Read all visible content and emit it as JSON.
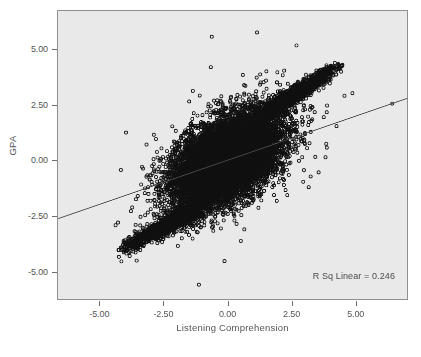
{
  "chart_data": {
    "type": "scatter",
    "title": "",
    "xlabel": "Listening Comprehension",
    "ylabel": "GPA",
    "xlim": [
      -6.65,
      7.04
    ],
    "ylim": [
      -6.27,
      6.74
    ],
    "xticks": [
      -5.0,
      -2.5,
      0.0,
      2.5,
      5.0
    ],
    "yticks": [
      5.0,
      2.5,
      0.0,
      -2.5,
      -5.0
    ],
    "xtick_labels": [
      "-5.00",
      "-2.50",
      "0.00",
      "2.50",
      "5.00"
    ],
    "ytick_labels": [
      "5.00",
      "2.50",
      "0.00",
      "-2.50",
      "-5.00"
    ],
    "grid": false,
    "legend": null,
    "annotations": [
      {
        "name": "r-squared",
        "text": "R Sq Linear = 0.246",
        "value": 0.246,
        "position": "bottom-right"
      }
    ],
    "fit_line": {
      "type": "linear",
      "r_squared": 0.246,
      "slope": 0.3965,
      "intercept": 0.0,
      "x_start": -6.65,
      "y_start": -2.64,
      "x_end": 7.04,
      "y_end": 2.79
    },
    "marker": {
      "shape": "circle-open",
      "size_px": 3.1,
      "edge_color": "#111111",
      "fill_color": "none",
      "edge_width_px": 0.8
    },
    "point_count_approx": 12000,
    "distribution": {
      "description": "dense bivariate cloud centered near origin with positive correlation, plus two linear spur tails extending to lower-left and upper-right",
      "core_center_x": -0.05,
      "core_center_y": 0.02,
      "core_sd_x": 1.05,
      "core_sd_y": 1.05,
      "correlation": 0.496,
      "spur_lower_left": {
        "x_from": -4.2,
        "x_to": -1.2,
        "y_from": -4.1,
        "y_to": -2.2
      },
      "spur_upper_right": {
        "x_from": 1.6,
        "x_to": 4.4,
        "y_from": 2.2,
        "y_to": 4.3
      }
    },
    "colors": {
      "plot_background": "#e9e9e9",
      "page_background": "#ffffff",
      "frame": "#8f8f8f",
      "point": "#111111",
      "fit_line": "#4b4b4b",
      "text": "#555555"
    }
  }
}
